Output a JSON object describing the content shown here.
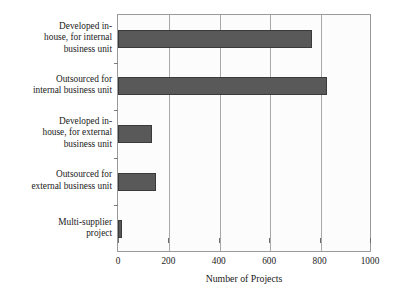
{
  "chart_data": {
    "type": "bar",
    "orientation": "horizontal",
    "title": "",
    "xlabel": "Number of Projects",
    "ylabel": "",
    "xlim": [
      0,
      1000
    ],
    "xticks": [
      0,
      200,
      400,
      600,
      800,
      1000
    ],
    "grid": "vertical",
    "legend": "none",
    "categories": [
      "Developed in-\nhouse, for internal\nbusiness unit",
      "Outsourced for\ninternal business unit",
      "Developed in-\nhouse, for external\nbusiness unit",
      "Outsourced for\nexternal business unit",
      "Multi-supplier\nproject"
    ],
    "values": [
      770,
      830,
      135,
      150,
      15
    ],
    "colors": {
      "bar_fill": "#595959",
      "bar_border": "#3a3a3a",
      "plot_background": "#fcfcfc",
      "frame": "#9a9a9a",
      "gridline": "#a8a8a8",
      "text": "#1a1a1a"
    }
  }
}
